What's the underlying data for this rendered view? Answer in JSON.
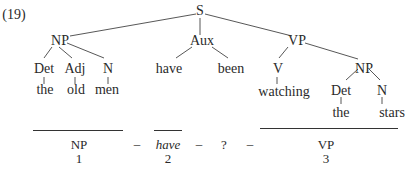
{
  "example_number": "(19)",
  "tree": {
    "root": "S",
    "np_subject": {
      "label": "NP",
      "det": "Det",
      "adj": "Adj",
      "n": "N",
      "det_word": "the",
      "adj_word": "old",
      "n_word": "men"
    },
    "aux": {
      "label": "Aux",
      "word1": "have",
      "word2": "been"
    },
    "vp": {
      "label": "VP",
      "v": "V",
      "v_word": "watching",
      "np": {
        "label": "NP",
        "det": "Det",
        "n": "N",
        "det_word": "the",
        "n_word": "stars"
      }
    }
  },
  "analysis": {
    "segments": [
      {
        "label": "NP",
        "index": "1"
      },
      {
        "label": "have",
        "index": "2"
      },
      {
        "label": "?",
        "index": ""
      },
      {
        "label": "VP",
        "index": "3"
      }
    ],
    "separator": "–"
  }
}
